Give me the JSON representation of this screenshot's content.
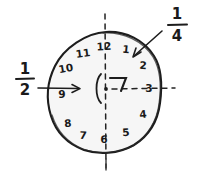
{
  "figure": {
    "ink_color": "#1d1d1d",
    "face_fill": "#f7f7f7",
    "background": "#ffffff"
  },
  "clock": {
    "name": "clock-face",
    "numerals": [
      {
        "label": "12",
        "hour": 12,
        "x": 104,
        "y": 47
      },
      {
        "label": "1",
        "hour": 1,
        "x": 126,
        "y": 50
      },
      {
        "label": "2",
        "hour": 2,
        "x": 143,
        "y": 66
      },
      {
        "label": "3",
        "hour": 3,
        "x": 149,
        "y": 89
      },
      {
        "label": "4",
        "hour": 4,
        "x": 143,
        "y": 115
      },
      {
        "label": "5",
        "hour": 5,
        "x": 126,
        "y": 133
      },
      {
        "label": "6",
        "hour": 6,
        "x": 104,
        "y": 140
      },
      {
        "label": "7",
        "hour": 7,
        "x": 83,
        "y": 136
      },
      {
        "label": "8",
        "hour": 8,
        "x": 68,
        "y": 124
      },
      {
        "label": "9",
        "hour": 9,
        "x": 62,
        "y": 95
      },
      {
        "label": "10",
        "hour": 10,
        "x": 66,
        "y": 69
      },
      {
        "label": "11",
        "hour": 11,
        "x": 83,
        "y": 54
      }
    ],
    "center": {
      "x": 106,
      "y": 89
    },
    "hands_mark": "right-angle-mark"
  },
  "annotations": {
    "half": {
      "name": "one-half-label",
      "numerator": "1",
      "denominator": "2",
      "value": "1/2",
      "x": 25,
      "y": 80,
      "arrow": "points-right-into-clock"
    },
    "quarter": {
      "name": "one-quarter-label",
      "numerator": "1",
      "denominator": "4",
      "value": "1/4",
      "x": 176,
      "y": 24,
      "arrow": "points-down-left-into-clock"
    }
  },
  "guides": {
    "vertical_dashed": {
      "name": "vertical-diameter-dashed",
      "from_hour": 12,
      "to_hour": 6
    },
    "horizontal_dashed": {
      "name": "horizontal-radius-dashed",
      "from_center": true,
      "to_hour": 3
    }
  }
}
